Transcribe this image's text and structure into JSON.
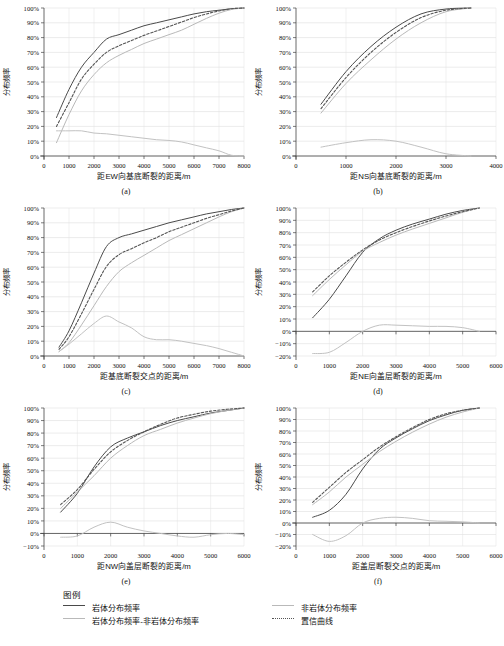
{
  "figure": {
    "axis_y_label": "分布频率",
    "unit_suffix": "/m"
  },
  "legend": {
    "title": "图例",
    "items": [
      {
        "id": "rock",
        "label": "岩体分布频率",
        "style": "solid",
        "color": "#4a4a4a"
      },
      {
        "id": "nonrock",
        "label": "非岩体分布频率",
        "style": "solid",
        "color": "#b9b9b9"
      },
      {
        "id": "diff",
        "label": "岩体分布频率-非岩体分布频率",
        "style": "solid",
        "color": "#c2c2c2"
      },
      {
        "id": "confidence",
        "label": "置信曲线",
        "style": "dotted",
        "color": "#555555"
      }
    ]
  },
  "chart_data": [
    {
      "id": "a",
      "caption": "(a)",
      "type": "line",
      "title": "",
      "xlabel": "距EW向基底断裂的距离/m",
      "ylabel": "分布频率",
      "xlim": [
        0,
        8000
      ],
      "ylim": [
        0,
        100
      ],
      "xticks": [
        0,
        1000,
        2000,
        3000,
        4000,
        5000,
        6000,
        7000,
        8000
      ],
      "yticks": [
        0,
        10,
        20,
        30,
        40,
        50,
        60,
        70,
        80,
        90,
        100
      ],
      "ytick_labels": [
        "0%",
        "10%",
        "20%",
        "30%",
        "40%",
        "50%",
        "60%",
        "70%",
        "80%",
        "90%",
        "100%"
      ],
      "grid": true,
      "legend_position": "below-figure",
      "x": [
        500,
        1000,
        1500,
        2000,
        2500,
        3000,
        3500,
        4000,
        4500,
        5000,
        5500,
        6000,
        6500,
        7000,
        7500,
        8000
      ],
      "series": [
        {
          "name": "岩体分布频率",
          "color": "#4a4a4a",
          "style": "solid",
          "values": [
            26,
            45,
            60,
            70,
            79,
            82,
            85,
            88,
            90,
            92,
            94,
            96,
            97.5,
            98.5,
            99.5,
            100
          ]
        },
        {
          "name": "非岩体分布频率",
          "color": "#b9b9b9",
          "style": "solid",
          "values": [
            9,
            28,
            44,
            55,
            63,
            68,
            72,
            76,
            79,
            82,
            85,
            89,
            93,
            96.5,
            99,
            100
          ]
        },
        {
          "name": "置信曲线",
          "color": "#555555",
          "style": "dotted",
          "values": [
            20,
            36,
            52,
            62,
            70,
            74.5,
            78,
            81.5,
            84.5,
            87.5,
            90.5,
            93.5,
            96,
            98,
            99.5,
            100
          ]
        },
        {
          "name": "岩体分布频率-非岩体分布频率",
          "color": "#c2c2c2",
          "style": "solid",
          "values": [
            17,
            17,
            17,
            15.5,
            15,
            14,
            13,
            12,
            11,
            10.5,
            9.5,
            7.5,
            5.5,
            3.5,
            0.5,
            0
          ]
        }
      ]
    },
    {
      "id": "b",
      "caption": "(b)",
      "type": "line",
      "title": "",
      "xlabel": "距NS向基底断裂的距离/m",
      "ylabel": "分布频率",
      "xlim": [
        0,
        4000
      ],
      "ylim": [
        0,
        100
      ],
      "xticks": [
        0,
        1000,
        2000,
        3000,
        4000
      ],
      "yticks": [
        0,
        10,
        20,
        30,
        40,
        50,
        60,
        70,
        80,
        90,
        100
      ],
      "ytick_labels": [
        "0%",
        "10%",
        "20%",
        "30%",
        "40%",
        "50%",
        "60%",
        "70%",
        "80%",
        "90%",
        "100%"
      ],
      "grid": true,
      "legend_position": "below-figure",
      "x": [
        500,
        1000,
        1500,
        2000,
        2500,
        3000,
        3500
      ],
      "series": [
        {
          "name": "岩体分布频率",
          "color": "#4a4a4a",
          "style": "solid",
          "values": [
            35,
            57,
            74,
            87,
            96,
            99.3,
            100
          ]
        },
        {
          "name": "非岩体分布频率",
          "color": "#b9b9b9",
          "style": "solid",
          "values": [
            29,
            49,
            65,
            79,
            90,
            97.5,
            100
          ]
        },
        {
          "name": "置信曲线",
          "color": "#555555",
          "style": "dotted",
          "values": [
            32,
            53,
            70,
            83.5,
            93.5,
            98.5,
            100
          ]
        },
        {
          "name": "岩体分布频率-非岩体分布频率",
          "color": "#c2c2c2",
          "style": "solid",
          "values": [
            6,
            9,
            11,
            10,
            6,
            1.5,
            0
          ]
        }
      ]
    },
    {
      "id": "c",
      "caption": "(c)",
      "type": "line",
      "title": "",
      "xlabel": "距基底断裂交点的距离/m",
      "ylabel": "分布频率",
      "xlim": [
        0,
        8000
      ],
      "ylim": [
        0,
        100
      ],
      "xticks": [
        0,
        1000,
        2000,
        3000,
        4000,
        5000,
        6000,
        7000,
        8000
      ],
      "yticks": [
        0,
        10,
        20,
        30,
        40,
        50,
        60,
        70,
        80,
        90,
        100
      ],
      "ytick_labels": [
        "0%",
        "10%",
        "20%",
        "30%",
        "40%",
        "50%",
        "60%",
        "70%",
        "80%",
        "90%",
        "100%"
      ],
      "grid": true,
      "legend_position": "below-figure",
      "x": [
        600,
        1000,
        1500,
        2000,
        2500,
        3000,
        3500,
        4000,
        4500,
        5000,
        5500,
        6000,
        6500,
        7000,
        7500,
        8000
      ],
      "series": [
        {
          "name": "岩体分布频率",
          "color": "#4a4a4a",
          "style": "solid",
          "values": [
            6,
            17,
            36,
            56,
            74,
            80,
            82.5,
            85,
            87.5,
            90,
            92,
            94,
            96,
            97.5,
            99,
            100
          ]
        },
        {
          "name": "非岩体分布频率",
          "color": "#b9b9b9",
          "style": "solid",
          "values": [
            3,
            9,
            21,
            34,
            47,
            57,
            63,
            68,
            73,
            78,
            82,
            86,
            90,
            94,
            97.5,
            100
          ]
        },
        {
          "name": "置信曲线",
          "color": "#555555",
          "style": "dotted",
          "values": [
            4.5,
            13,
            28.5,
            45,
            60.5,
            68.5,
            72.5,
            76.5,
            80,
            84,
            87,
            90,
            93,
            95.5,
            98,
            100
          ]
        },
        {
          "name": "岩体分布频率-非岩体分布频率",
          "color": "#c2c2c2",
          "style": "solid",
          "values": [
            3,
            8,
            15,
            22,
            27,
            23,
            19,
            13,
            11,
            11,
            10,
            8.5,
            7,
            5,
            2.5,
            0
          ]
        }
      ]
    },
    {
      "id": "d",
      "caption": "(d)",
      "type": "line",
      "title": "",
      "xlabel": "距NE向盖层断裂的距离/m",
      "ylabel": "分布频率",
      "xlim": [
        0,
        6000
      ],
      "ylim": [
        -20,
        100
      ],
      "xticks": [
        0,
        1000,
        2000,
        3000,
        4000,
        5000,
        6000
      ],
      "yticks": [
        -20,
        -10,
        0,
        10,
        20,
        30,
        40,
        50,
        60,
        70,
        80,
        90,
        100
      ],
      "ytick_labels": [
        "−20%",
        "−10%",
        "0%",
        "10%",
        "20%",
        "30%",
        "40%",
        "50%",
        "60%",
        "70%",
        "80%",
        "90%",
        "100%"
      ],
      "grid": true,
      "legend_position": "below-figure",
      "x": [
        500,
        1000,
        1500,
        2000,
        2500,
        3000,
        3500,
        4000,
        4500,
        5000,
        5500
      ],
      "series": [
        {
          "name": "岩体分布频率",
          "color": "#4a4a4a",
          "style": "solid",
          "values": [
            11,
            26,
            45,
            64,
            75,
            82,
            87,
            91,
            95,
            98,
            100
          ]
        },
        {
          "name": "非岩体分布频率",
          "color": "#b9b9b9",
          "style": "solid",
          "values": [
            29,
            42,
            54,
            65,
            72,
            78,
            83,
            87.5,
            92,
            96.5,
            100
          ]
        },
        {
          "name": "置信曲线",
          "color": "#555555",
          "style": "dotted",
          "values": [
            32,
            45,
            56,
            66,
            74,
            80,
            85,
            89.5,
            93.5,
            97,
            100
          ]
        },
        {
          "name": "岩体分布频率-非岩体分布频率",
          "color": "#c2c2c2",
          "style": "solid",
          "values": [
            -18,
            -17,
            -9,
            0,
            5,
            5,
            4.5,
            4,
            4,
            3,
            0
          ]
        }
      ]
    },
    {
      "id": "e",
      "caption": "(e)",
      "type": "line",
      "title": "",
      "xlabel": "距NW向盖层断裂的距离/m",
      "ylabel": "分布频率",
      "xlim": [
        0,
        6000
      ],
      "ylim": [
        -10,
        100
      ],
      "xticks": [
        0,
        1000,
        2000,
        3000,
        4000,
        5000,
        6000
      ],
      "yticks": [
        -10,
        0,
        10,
        20,
        30,
        40,
        50,
        60,
        70,
        80,
        90,
        100
      ],
      "ytick_labels": [
        "−10%",
        "0%",
        "10%",
        "20%",
        "30%",
        "40%",
        "50%",
        "60%",
        "70%",
        "80%",
        "90%",
        "100%"
      ],
      "grid": true,
      "legend_position": "below-figure",
      "x": [
        500,
        1000,
        1500,
        2000,
        2500,
        3000,
        3500,
        4000,
        4500,
        5000,
        5500,
        6000
      ],
      "series": [
        {
          "name": "岩体分布频率",
          "color": "#4a4a4a",
          "style": "solid",
          "values": [
            17,
            32,
            53,
            69,
            76,
            81,
            86,
            90,
            93,
            96,
            98,
            100
          ]
        },
        {
          "name": "非岩体分布频率",
          "color": "#b9b9b9",
          "style": "solid",
          "values": [
            20,
            33,
            46,
            60,
            70,
            78,
            83,
            88,
            92,
            95.5,
            98,
            100
          ]
        },
        {
          "name": "置信曲线",
          "color": "#555555",
          "style": "dotted",
          "values": [
            23,
            35,
            51,
            65,
            74,
            81,
            87,
            92,
            95,
            97.5,
            99,
            100
          ]
        },
        {
          "name": "岩体分布频率-非岩体分布频率",
          "color": "#c2c2c2",
          "style": "solid",
          "values": [
            -3,
            -2,
            5,
            9,
            5,
            2,
            0,
            -2,
            -3,
            -1,
            0,
            -1
          ]
        }
      ]
    },
    {
      "id": "f",
      "caption": "(f)",
      "type": "line",
      "title": "",
      "xlabel": "距盖层断裂交点的距离/m",
      "ylabel": "分布频率",
      "xlim": [
        0,
        6000
      ],
      "ylim": [
        -20,
        100
      ],
      "xticks": [
        0,
        1000,
        2000,
        3000,
        4000,
        5000,
        6000
      ],
      "yticks": [
        -20,
        -10,
        0,
        10,
        20,
        30,
        40,
        50,
        60,
        70,
        80,
        90,
        100
      ],
      "ytick_labels": [
        "−20%",
        "−10%",
        "0%",
        "10%",
        "20%",
        "30%",
        "40%",
        "50%",
        "60%",
        "70%",
        "80%",
        "90%",
        "100%"
      ],
      "grid": true,
      "legend_position": "below-figure",
      "x": [
        500,
        1000,
        1500,
        2000,
        2500,
        3000,
        3500,
        4000,
        4500,
        5000,
        5500
      ],
      "series": [
        {
          "name": "岩体分布频率",
          "color": "#4a4a4a",
          "style": "solid",
          "values": [
            5,
            11,
            25,
            47,
            64,
            74,
            82,
            89,
            94,
            98,
            100
          ]
        },
        {
          "name": "非岩体分布频率",
          "color": "#b9b9b9",
          "style": "solid",
          "values": [
            16,
            27,
            40,
            51,
            62,
            71,
            79,
            86,
            92,
            96.5,
            100
          ]
        },
        {
          "name": "置信曲线",
          "color": "#555555",
          "style": "dotted",
          "values": [
            18,
            31,
            44,
            55,
            66,
            75,
            83,
            90,
            95,
            98,
            100
          ]
        },
        {
          "name": "岩体分布频率-非岩体分布频率",
          "color": "#c2c2c2",
          "style": "solid",
          "values": [
            -10,
            -16,
            -11,
            0,
            4,
            5,
            4,
            2,
            1.5,
            1,
            0
          ]
        }
      ]
    }
  ]
}
